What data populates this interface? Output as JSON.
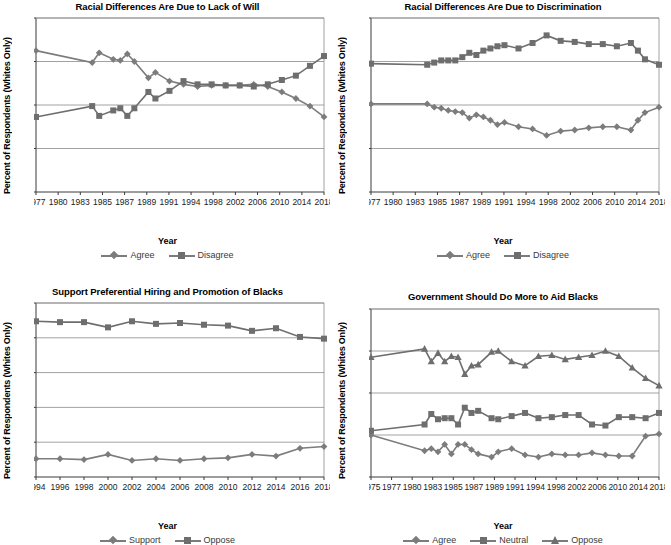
{
  "figure": {
    "panels": [
      "top-left",
      "top-right",
      "bottom-left",
      "bottom-right"
    ]
  },
  "chart_data": [
    {
      "type": "line",
      "panel": "top-left",
      "title": "Racial Differences Are Due to Lack of Will",
      "xlabel": "Year",
      "ylabel": "Percent of Respondents (Whites Only)",
      "ylim": [
        0,
        80
      ],
      "yticks": [
        0,
        20,
        40,
        60,
        80
      ],
      "xticklabels": [
        "1977",
        "1980",
        "1983",
        "1985",
        "1987",
        "1989",
        "1991",
        "1994",
        "1998",
        "2002",
        "2006",
        "2010",
        "2014",
        "2018"
      ],
      "grid": "horizontal",
      "legend_position": "below",
      "x": [
        1977,
        1985,
        1986,
        1988,
        1989,
        1990,
        1991,
        1993,
        1994,
        1996,
        1998,
        2000,
        2002,
        2004,
        2006,
        2008,
        2010,
        2012,
        2014,
        2016,
        2018
      ],
      "series": [
        {
          "name": "Agree",
          "marker": "diamond",
          "color": "#7c7c7c",
          "values": [
            65,
            59.5,
            64,
            61,
            60.5,
            63.5,
            60,
            52.5,
            55,
            51,
            49.5,
            48.5,
            49,
            49,
            49,
            49.5,
            48.5,
            46,
            43,
            39.5,
            34.5
          ]
        },
        {
          "name": "Disagree",
          "marker": "square",
          "color": "#6e6e6e",
          "values": [
            34.5,
            39.5,
            35,
            37.5,
            38.5,
            35,
            38.5,
            46,
            43,
            46.5,
            51,
            49.5,
            49.5,
            49,
            49,
            48.5,
            49.5,
            51.5,
            53.5,
            58,
            62.5
          ]
        }
      ]
    },
    {
      "type": "line",
      "panel": "top-right",
      "title": "Racial Differences Are Due to Discrimination",
      "xlabel": "Year",
      "ylabel": "Percent of Respondents (Whites Only)",
      "ylim": [
        0,
        80
      ],
      "yticks": [
        0,
        20,
        40,
        60,
        80
      ],
      "xticklabels": [
        "1977",
        "1980",
        "1983",
        "1985",
        "1987",
        "1989",
        "1991",
        "1994",
        "1998",
        "2002",
        "2006",
        "2010",
        "2014",
        "2018"
      ],
      "grid": "horizontal",
      "legend_position": "below",
      "x": [
        1977,
        1985,
        1986,
        1987,
        1988,
        1989,
        1990,
        1991,
        1992,
        1993,
        1994,
        1995,
        1996,
        1998,
        2000,
        2002,
        2004,
        2006,
        2008,
        2010,
        2012,
        2014,
        2015,
        2016,
        2018
      ],
      "series": [
        {
          "name": "Agree",
          "marker": "diamond",
          "color": "#7c7c7c",
          "values": [
            40.5,
            40.5,
            39,
            38.5,
            37.5,
            37,
            36.5,
            34,
            35.5,
            34.5,
            33,
            31,
            32,
            30,
            29,
            26,
            28,
            28.5,
            29.5,
            30,
            30,
            28.5,
            33,
            36.5,
            39
          ]
        },
        {
          "name": "Disagree",
          "marker": "square",
          "color": "#6e6e6e",
          "values": [
            59,
            58.5,
            59.5,
            60.5,
            60.5,
            60.5,
            62,
            64,
            63,
            65,
            66,
            67,
            67.5,
            66,
            68.5,
            72,
            69.5,
            69,
            68,
            68,
            67,
            68.5,
            65,
            61,
            58.5
          ]
        }
      ]
    },
    {
      "type": "line",
      "panel": "bottom-left",
      "title": "Support Preferential Hiring and Promotion of Blacks",
      "xlabel": "Year",
      "ylabel": "Percent of Respondents (Whites Only)",
      "ylim": [
        0,
        100
      ],
      "yticks": [
        0,
        20,
        40,
        60,
        80,
        100
      ],
      "xticklabels": [
        "1994",
        "1996",
        "1998",
        "2000",
        "2002",
        "2004",
        "2006",
        "2008",
        "2010",
        "2012",
        "2014",
        "2016",
        "2018"
      ],
      "grid": "horizontal",
      "legend_position": "below",
      "x": [
        1994,
        1996,
        1998,
        2000,
        2002,
        2004,
        2006,
        2008,
        2010,
        2012,
        2014,
        2016,
        2018
      ],
      "series": [
        {
          "name": "Support",
          "marker": "diamond",
          "color": "#7c7c7c",
          "values": [
            10.5,
            10.5,
            10,
            13,
            9.5,
            10.5,
            9.5,
            10.5,
            11,
            13,
            12,
            16.5,
            17.5
          ]
        },
        {
          "name": "Oppose",
          "marker": "square",
          "color": "#6e6e6e",
          "values": [
            89.5,
            89,
            89,
            86,
            89.5,
            88,
            88.5,
            87.5,
            87,
            84,
            85.5,
            80.5,
            79.5
          ]
        }
      ]
    },
    {
      "type": "line",
      "panel": "bottom-right",
      "title": "Government Should Do More to Aid Blacks",
      "xlabel": "Year",
      "ylabel": "Percent of Respondents (Whites Only)",
      "ylim": [
        0,
        80
      ],
      "yticks": [
        0,
        20,
        40,
        60,
        80
      ],
      "xticklabels": [
        "1975",
        "1977",
        "1980",
        "1983",
        "1985",
        "1987",
        "1989",
        "1991",
        "1994",
        "1998",
        "2002",
        "2006",
        "2010",
        "2014",
        "2018"
      ],
      "grid": "horizontal",
      "legend_position": "below",
      "x": [
        1975,
        1983,
        1984,
        1985,
        1986,
        1987,
        1988,
        1989,
        1990,
        1991,
        1993,
        1994,
        1996,
        1998,
        2000,
        2002,
        2004,
        2006,
        2008,
        2010,
        2012,
        2014,
        2016,
        2018
      ],
      "series": [
        {
          "name": "Agree",
          "marker": "diamond",
          "color": "#7c7c7c",
          "values": [
            20,
            12.5,
            13.5,
            12,
            15.5,
            11,
            15.5,
            15.5,
            13,
            11,
            9.5,
            12,
            13.5,
            10.5,
            9.5,
            11,
            10.5,
            10.5,
            11.5,
            10.5,
            10,
            10,
            19.5,
            20.5
          ]
        },
        {
          "name": "Neutral",
          "marker": "square",
          "color": "#6e6e6e",
          "values": [
            22,
            25,
            30,
            27.5,
            28,
            28,
            25,
            33,
            30.5,
            31.5,
            28,
            27.5,
            29,
            30.5,
            28,
            28.5,
            29.5,
            29.5,
            25,
            24.5,
            28.5,
            28.5,
            28,
            30.5
          ]
        },
        {
          "name": "Oppose",
          "marker": "triangle",
          "color": "#6e6e6e",
          "values": [
            57,
            61,
            55,
            59,
            55,
            57.5,
            57,
            49,
            53,
            53.5,
            59.5,
            60,
            55,
            53,
            57.5,
            58,
            56,
            57,
            58,
            60,
            57.5,
            52,
            47,
            43.5
          ]
        }
      ]
    }
  ]
}
